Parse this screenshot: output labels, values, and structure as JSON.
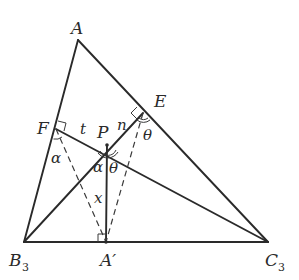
{
  "figure": {
    "points": {
      "A": {
        "label": "A",
        "x": 78,
        "y": 40
      },
      "B3": {
        "label": "B",
        "sub": "3",
        "x": 24,
        "y": 242
      },
      "C3": {
        "label": "C",
        "sub": "3",
        "x": 268,
        "y": 242
      },
      "A_prime": {
        "label": "A′",
        "x": 106,
        "y": 242
      },
      "F": {
        "label": "F",
        "x": 56,
        "y": 129
      },
      "E": {
        "label": "E",
        "x": 143,
        "y": 113
      },
      "P": {
        "label": "P",
        "x": 107,
        "y": 145
      }
    },
    "segment_labels": {
      "t": "t",
      "n": "n",
      "x": "x"
    },
    "angle_labels": {
      "alpha_at_F": "α",
      "alpha_at_P": "α",
      "theta_at_P": "θ",
      "theta_at_E": "θ"
    },
    "colors": {
      "stroke": "#2a2a2a",
      "background": "#ffffff"
    }
  }
}
